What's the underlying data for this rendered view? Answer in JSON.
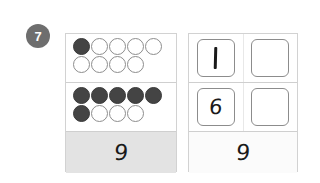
{
  "question": {
    "number": "7",
    "badge_color": "#6e6e6e"
  },
  "frames_panel": {
    "name": "ten-frame counters panel",
    "rows": [
      {
        "row_index": 1,
        "filled_count": 1,
        "empty_count": 8,
        "total_counters": 9,
        "lines": [
          [
            "filled",
            "empty",
            "empty",
            "empty",
            "empty"
          ],
          [
            "empty",
            "empty",
            "empty",
            "empty"
          ]
        ]
      },
      {
        "row_index": 2,
        "filled_count": 6,
        "empty_count": 3,
        "total_counters": 9,
        "lines": [
          [
            "filled",
            "filled",
            "filled",
            "filled",
            "filled"
          ],
          [
            "filled",
            "empty",
            "empty",
            "empty"
          ]
        ]
      }
    ],
    "total_label": "9"
  },
  "answers_panel": {
    "name": "answer boxes panel",
    "rows": [
      {
        "row_index": 1,
        "cells": [
          {
            "value": "1",
            "filled": true,
            "glyph": "stroke"
          },
          {
            "value": "",
            "filled": false,
            "glyph": "empty"
          }
        ]
      },
      {
        "row_index": 2,
        "cells": [
          {
            "value": "6",
            "filled": true,
            "glyph": "digit"
          },
          {
            "value": "",
            "filled": false,
            "glyph": "empty"
          }
        ]
      }
    ],
    "total_label": "9"
  },
  "colors": {
    "counter_filled": "#444444",
    "counter_outline": "#8d8d8d",
    "panel_border": "#d2d2d2",
    "shaded_strip": "#e3e3e3",
    "box_border": "#8c8c8c"
  }
}
